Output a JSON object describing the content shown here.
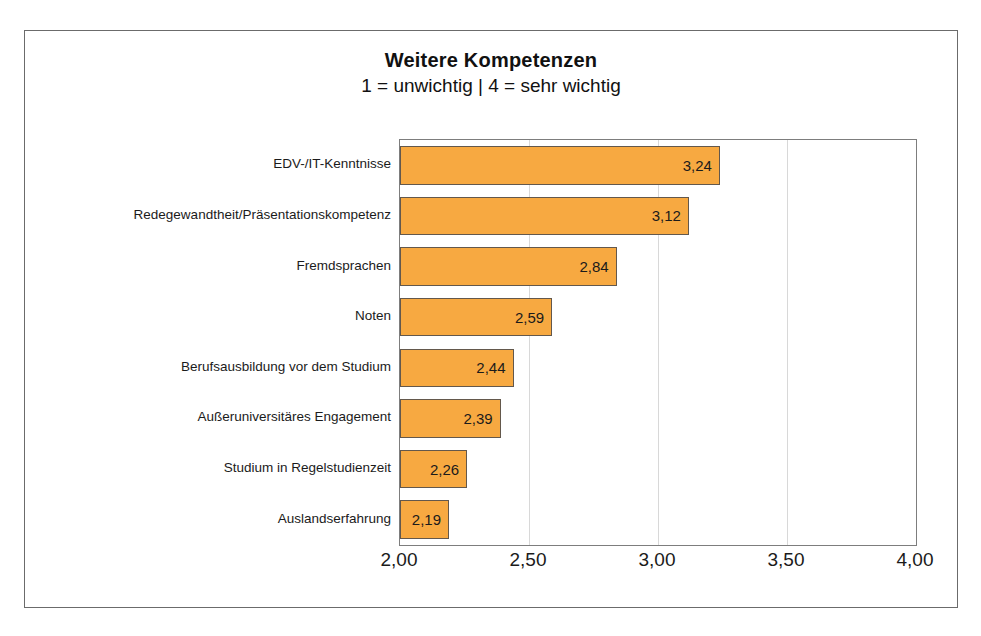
{
  "chart_data": {
    "type": "bar",
    "orientation": "horizontal",
    "title": "Weitere Kompetenzen",
    "subtitle": "1 = unwichtig | 4 = sehr wichtig",
    "xlabel": "",
    "ylabel": "",
    "xlim": [
      2.0,
      4.0
    ],
    "xticks": [
      2.0,
      2.5,
      3.0,
      3.5,
      4.0
    ],
    "xtick_labels": [
      "2,00",
      "2,50",
      "3,00",
      "3,50",
      "4,00"
    ],
    "grid": true,
    "grid_axis": "x",
    "legend": false,
    "categories": [
      "EDV-/IT-Kenntnisse",
      "Redegewandtheit/Präsentationskompetenz",
      "Fremdsprachen",
      "Noten",
      "Berufsausbildung vor dem Studium",
      "Außeruniversitäres Engagement",
      "Studium in Regelstudienzeit",
      "Auslandserfahrung"
    ],
    "values": [
      3.24,
      3.12,
      2.84,
      2.59,
      2.44,
      2.39,
      2.26,
      2.19
    ],
    "value_labels": [
      "3,24",
      "3,12",
      "2,84",
      "2,59",
      "2,44",
      "2,39",
      "2,26",
      "2,19"
    ],
    "bar_color": "#f7a941",
    "bar_border_color": "#63584c",
    "grid_color": "#d8d8d8",
    "frame_color": "#6b6b6b",
    "background_color": "#ffffff"
  }
}
